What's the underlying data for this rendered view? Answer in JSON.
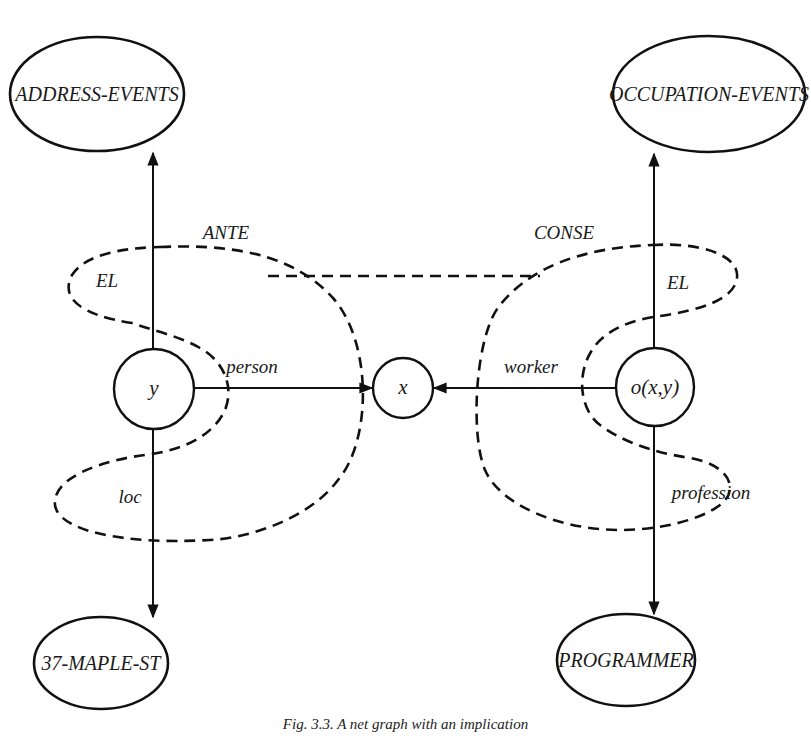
{
  "diagram": {
    "nodes": {
      "address_events": {
        "label": "ADDRESS-EVENTS",
        "shape": "ellipse"
      },
      "occupation_events": {
        "label": "OCCUPATION-EVENTS",
        "shape": "ellipse"
      },
      "maple_st": {
        "label": "37-MAPLE-ST",
        "shape": "ellipse"
      },
      "programmer": {
        "label": "PROGRAMMER",
        "shape": "ellipse"
      },
      "y": {
        "label": "y",
        "shape": "circle"
      },
      "x": {
        "label": "x",
        "shape": "circle"
      },
      "o": {
        "label": "o(x,y)",
        "shape": "circle"
      }
    },
    "edges": {
      "person": {
        "label": "person",
        "from": "y",
        "to": "x"
      },
      "worker": {
        "label": "worker",
        "from": "o(x,y)",
        "to": "x"
      },
      "el_left": {
        "label": "EL",
        "from": "y",
        "to": "ADDRESS-EVENTS"
      },
      "el_right": {
        "label": "EL",
        "from": "o(x,y)",
        "to": "OCCUPATION-EVENTS"
      },
      "loc": {
        "label": "loc",
        "from": "y",
        "to": "37-MAPLE-ST"
      },
      "profession": {
        "label": "profession",
        "from": "o(x,y)",
        "to": "PROGRAMMER"
      }
    },
    "contexts": {
      "ante": {
        "label": "ANTE"
      },
      "conse": {
        "label": "CONSE"
      }
    },
    "caption": "Fig. 3.3. A net graph with an implication"
  },
  "colors": {
    "ink": "#111111",
    "background": "#ffffff"
  }
}
